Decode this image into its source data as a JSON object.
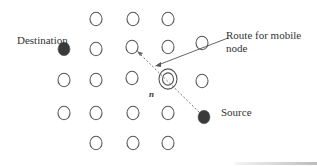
{
  "diagram": {
    "labels": {
      "destination": "Destination",
      "source": "Source",
      "route": "Route for mobile\nnode",
      "route_line1": "Route for mobile",
      "route_line2": "node",
      "mobile_node": "n"
    },
    "colors": {
      "node_stroke": "#555555",
      "filled_node": "#3a3a3a",
      "route_line": "#777777",
      "pointer_line": "#555555"
    },
    "nodes": [
      {
        "x": 96,
        "y": 19,
        "type": "hollow"
      },
      {
        "x": 133,
        "y": 19,
        "type": "hollow"
      },
      {
        "x": 168,
        "y": 19,
        "type": "hollow"
      },
      {
        "x": 64,
        "y": 49,
        "type": "filled",
        "role": "destination"
      },
      {
        "x": 96,
        "y": 49,
        "type": "hollow"
      },
      {
        "x": 132,
        "y": 47,
        "type": "hollow"
      },
      {
        "x": 168,
        "y": 47,
        "type": "hollow"
      },
      {
        "x": 202,
        "y": 43,
        "type": "hollow"
      },
      {
        "x": 64,
        "y": 80,
        "type": "hollow"
      },
      {
        "x": 96,
        "y": 80,
        "type": "hollow"
      },
      {
        "x": 132,
        "y": 78,
        "type": "hollow"
      },
      {
        "x": 168,
        "y": 79,
        "type": "double",
        "role": "mobile-node"
      },
      {
        "x": 202,
        "y": 81,
        "type": "hollow"
      },
      {
        "x": 64,
        "y": 113,
        "type": "hollow"
      },
      {
        "x": 96,
        "y": 113,
        "type": "hollow"
      },
      {
        "x": 133,
        "y": 113,
        "type": "hollow"
      },
      {
        "x": 168,
        "y": 113,
        "type": "hollow"
      },
      {
        "x": 204,
        "y": 117,
        "type": "filled",
        "role": "source"
      },
      {
        "x": 96,
        "y": 143,
        "type": "hollow"
      },
      {
        "x": 133,
        "y": 143,
        "type": "hollow"
      },
      {
        "x": 168,
        "y": 143,
        "type": "hollow"
      }
    ]
  }
}
